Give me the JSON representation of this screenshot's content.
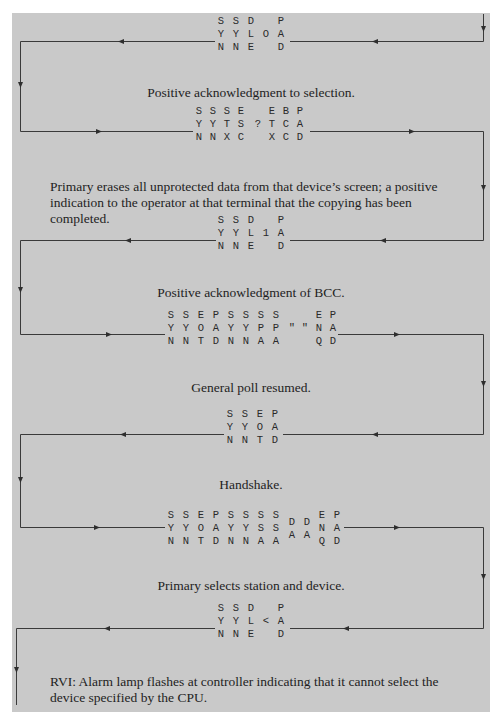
{
  "document": {
    "title": "BSC polling/selection message flow (continued)",
    "background_color": "#c9c9c9",
    "line_color": "#3a3a3a"
  },
  "sequences": [
    {
      "id": "seq1",
      "direction": "right-to-left",
      "columns": [
        [
          "S",
          "Y",
          "N"
        ],
        [
          "S",
          "Y",
          "N"
        ],
        [
          "D",
          "L",
          "E"
        ],
        [
          "",
          "O",
          ""
        ],
        [
          "P",
          "A",
          "D"
        ]
      ],
      "caption": "Positive acknowledgment to selection."
    },
    {
      "id": "seq2",
      "direction": "left-to-right",
      "columns": [
        [
          "S",
          "Y",
          "N"
        ],
        [
          "S",
          "Y",
          "N"
        ],
        [
          "S",
          "T",
          "X"
        ],
        [
          "E",
          "S",
          "C"
        ],
        [
          "",
          "?",
          ""
        ],
        [
          "E",
          "T",
          "X"
        ],
        [
          "B",
          "C",
          "C"
        ],
        [
          "P",
          "A",
          "D"
        ]
      ],
      "caption": "Primary erases all unprotected data from that device’s screen; a positive indication to the operator at that terminal that the copying has been completed."
    },
    {
      "id": "seq3",
      "direction": "right-to-left",
      "columns": [
        [
          "S",
          "Y",
          "N"
        ],
        [
          "S",
          "Y",
          "N"
        ],
        [
          "D",
          "L",
          "E"
        ],
        [
          "",
          "1",
          ""
        ],
        [
          "P",
          "A",
          "D"
        ]
      ],
      "caption": "Positive acknowledgment of BCC."
    },
    {
      "id": "seq4",
      "direction": "left-to-right",
      "columns": [
        [
          "S",
          "Y",
          "N"
        ],
        [
          "S",
          "Y",
          "N"
        ],
        [
          "E",
          "O",
          "T"
        ],
        [
          "P",
          "A",
          "D"
        ],
        [
          "S",
          "Y",
          "N"
        ],
        [
          "S",
          "Y",
          "N"
        ],
        [
          "S",
          "P",
          "A"
        ],
        [
          "S",
          "P",
          "A"
        ],
        [
          "",
          "\"",
          ""
        ],
        [
          "",
          "\"",
          ""
        ],
        [
          "E",
          "N",
          "Q"
        ],
        [
          "P",
          "A",
          "D"
        ]
      ],
      "caption": "General poll resumed."
    },
    {
      "id": "seq5",
      "direction": "right-to-left",
      "columns": [
        [
          "S",
          "Y",
          "N"
        ],
        [
          "S",
          "Y",
          "N"
        ],
        [
          "E",
          "O",
          "T"
        ],
        [
          "P",
          "A",
          "D"
        ]
      ],
      "caption": "Handshake."
    },
    {
      "id": "seq6",
      "direction": "left-to-right",
      "columns": [
        [
          "S",
          "Y",
          "N"
        ],
        [
          "S",
          "Y",
          "N"
        ],
        [
          "E",
          "O",
          "T"
        ],
        [
          "P",
          "A",
          "D"
        ],
        [
          "S",
          "Y",
          "N"
        ],
        [
          "S",
          "Y",
          "N"
        ],
        [
          "S",
          "S",
          "A"
        ],
        [
          "S",
          "S",
          "A"
        ],
        [
          "D",
          "A",
          ""
        ],
        [
          "D",
          "A",
          ""
        ],
        [
          "E",
          "N",
          "Q"
        ],
        [
          "P",
          "A",
          "D"
        ]
      ],
      "caption": "Primary selects station and device."
    },
    {
      "id": "seq7",
      "direction": "right-to-left",
      "columns": [
        [
          "S",
          "Y",
          "N"
        ],
        [
          "S",
          "Y",
          "N"
        ],
        [
          "D",
          "L",
          "E"
        ],
        [
          "",
          "<",
          ""
        ],
        [
          "P",
          "A",
          "D"
        ]
      ],
      "caption": "RVI: Alarm lamp flashes at controller indicating that it cannot select the device specified by the CPU."
    }
  ]
}
